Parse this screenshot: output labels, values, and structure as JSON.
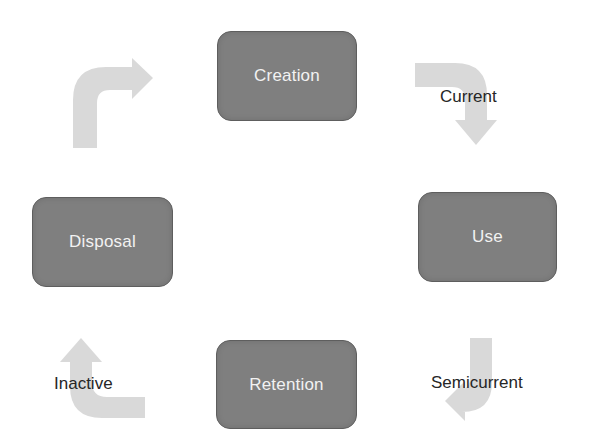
{
  "diagram": {
    "type": "cycle",
    "stages": [
      {
        "id": "creation",
        "label": "Creation"
      },
      {
        "id": "use",
        "label": "Use"
      },
      {
        "id": "retention",
        "label": "Retention"
      },
      {
        "id": "disposal",
        "label": "Disposal"
      }
    ],
    "transitions": [
      {
        "from": "creation",
        "to": "use",
        "label": "Current"
      },
      {
        "from": "use",
        "to": "retention",
        "label": "Semicurrent"
      },
      {
        "from": "retention",
        "to": "disposal",
        "label": "Inactive"
      },
      {
        "from": "disposal",
        "to": "creation",
        "label": ""
      }
    ]
  },
  "colors": {
    "box_fill": "#7f7f7f",
    "box_text": "#f2f2f2",
    "arrow_fill": "#d9d9d9",
    "label_text": "#262626",
    "background": "#ffffff"
  }
}
